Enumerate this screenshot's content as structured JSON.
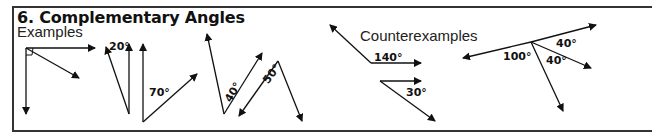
{
  "title": "6. Complementary Angles",
  "sections": {
    "examples_label": "Examples",
    "counterexamples_label": "Counterexamples"
  },
  "angle_labels": {
    "ex2": "20°",
    "ex3": "70°",
    "ex4": "40°",
    "ex5": "50°",
    "cx1": "140°",
    "cx2": "30°",
    "cx3_a": "100°",
    "cx3_b": "40°",
    "cx3_c": "40°"
  },
  "colors": {
    "ink": "#111111",
    "border": "#333333",
    "background": "#ffffff"
  }
}
